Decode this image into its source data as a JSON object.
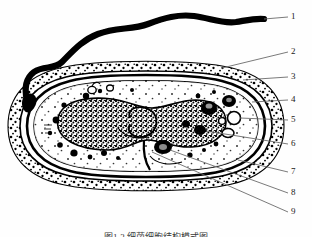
{
  "figure": {
    "caption": "图1-3  细菌细胞结构模式图",
    "caption_visible": "partially cut off at bottom edge",
    "style": "black and white ink line drawing, stippled shading",
    "background_color": "#ffffff",
    "ink_color": "#000000",
    "leader_line_color": "#6b6b6b"
  },
  "labels": [
    {
      "id": "1",
      "text": "1",
      "x": 293,
      "y": 16,
      "target": "flagellum-tip"
    },
    {
      "id": "2",
      "text": "2",
      "x": 293,
      "y": 51,
      "target": "capsule-outer-layer"
    },
    {
      "id": "3",
      "text": "3",
      "x": 293,
      "y": 76,
      "target": "cell-wall"
    },
    {
      "id": "4",
      "text": "4",
      "x": 293,
      "y": 100,
      "target": "cytoplasmic-membrane"
    },
    {
      "id": "5",
      "text": "5",
      "x": 293,
      "y": 119,
      "target": "inclusion-vacuole"
    },
    {
      "id": "6",
      "text": "6",
      "x": 293,
      "y": 143,
      "target": "nucleoid-region"
    },
    {
      "id": "7",
      "text": "7",
      "x": 293,
      "y": 171,
      "target": "cytoplasm"
    },
    {
      "id": "8",
      "text": "8",
      "x": 293,
      "y": 192,
      "target": "ribosome-granule"
    },
    {
      "id": "9",
      "text": "9",
      "x": 293,
      "y": 211,
      "target": "mesosome"
    }
  ],
  "parts": {
    "flagellum": "single polar wavy flagellum extending up and to the right",
    "capsule": "stippled outer capsule layer surrounding the cell",
    "cell_wall": "thick dark outline beneath the capsule",
    "membrane": "inner oval outline enclosing the cytoplasm",
    "nucleoid": "dense irregular speckled mass in the cell center",
    "granules": "dark round inclusion bodies scattered in the cytoplasm",
    "vacuoles": "open white circular vacuoles at the right end"
  }
}
